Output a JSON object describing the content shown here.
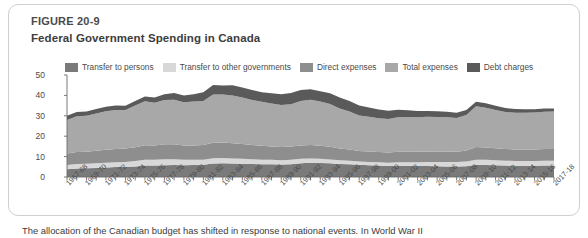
{
  "figure": {
    "number": "FIGURE 20-9",
    "title": "Federal Government Spending in Canada",
    "caption": "The allocation of the Canadian budget has shifted in response to national events. In World War II"
  },
  "legend": {
    "position": "top",
    "items": [
      {
        "label": "Transfer to persons",
        "color": "#7a7a7a",
        "icon": "legend-swatch"
      },
      {
        "label": "Transfer to other governments",
        "color": "#d8d8d8",
        "icon": "legend-swatch"
      },
      {
        "label": "Direct expenses",
        "color": "#8e8e8e",
        "icon": "legend-swatch"
      },
      {
        "label": "Total expenses",
        "color": "#a8a8a8",
        "icon": "legend-swatch"
      },
      {
        "label": "Debt charges",
        "color": "#5a5a5a",
        "icon": "legend-swatch"
      }
    ]
  },
  "chart_data": {
    "type": "area",
    "title": "Federal Government Spending in Canada",
    "xlabel": "",
    "ylabel": "",
    "ylim": [
      0,
      50
    ],
    "yticks": [
      0,
      10,
      20,
      30,
      40,
      50
    ],
    "ytick_labels": [
      "0",
      "10",
      "20",
      "30",
      "40",
      "50"
    ],
    "grid": false,
    "stacked": true,
    "legend_position": "top",
    "categories": [
      "1967-68",
      "1968-69",
      "1969-70",
      "1970-71",
      "1971-72",
      "1972-73",
      "1973-74",
      "1974-75",
      "1975-76",
      "1976-77",
      "1977-78",
      "1978-79",
      "1979-80",
      "1980-81",
      "1981-82",
      "1982-83",
      "1983-84",
      "1984-85",
      "1985-86",
      "1986-87",
      "1987-88",
      "1988-89",
      "1989-90",
      "1990-91",
      "1991-92",
      "1992-93",
      "1993-94",
      "1994-95",
      "1995-96",
      "1996-97",
      "1997-98",
      "1998-99",
      "1999-00",
      "2000-01",
      "2001-02",
      "2002-03",
      "2003-04",
      "2004-05",
      "2005-06",
      "2006-07",
      "2007-08",
      "2008-09",
      "2009-10",
      "2010-11",
      "2011-12",
      "2012-13",
      "2013-14",
      "2014-15",
      "2015-16",
      "2016-17",
      "2017-18"
    ],
    "xtick_labels": [
      "1967-68",
      "1969-70",
      "1971-72",
      "1973-74",
      "1975-76",
      "1977-78",
      "1979-80",
      "1981-82",
      "1983-84",
      "1985-86",
      "1987-88",
      "1989-90",
      "1991-92",
      "1993-94",
      "1995-96",
      "1997-98",
      "1999-00",
      "2001-02",
      "2003-04",
      "2005-06",
      "2007-08",
      "2009-10",
      "2011-12",
      "2013-14",
      "2015-16",
      "2017-18"
    ],
    "series": [
      {
        "name": "Transfer to persons",
        "color": "#7a7a7a",
        "values": [
          3.8,
          4.2,
          4.3,
          4.4,
          4.6,
          4.9,
          5.0,
          5.2,
          5.6,
          5.6,
          5.8,
          5.9,
          5.8,
          5.9,
          6.0,
          6.6,
          6.7,
          6.6,
          6.5,
          6.4,
          6.3,
          6.2,
          6.1,
          6.3,
          6.8,
          7.0,
          6.9,
          6.7,
          6.4,
          6.3,
          6.0,
          5.8,
          5.6,
          5.4,
          5.5,
          5.5,
          5.4,
          5.4,
          5.3,
          5.2,
          5.1,
          5.3,
          6.0,
          5.9,
          5.7,
          5.6,
          5.5,
          5.5,
          5.5,
          5.6,
          5.6
        ]
      },
      {
        "name": "Transfer to other governments",
        "color": "#d8d8d8",
        "values": [
          2.1,
          2.2,
          2.2,
          2.3,
          2.4,
          2.3,
          2.4,
          2.6,
          2.8,
          2.8,
          2.9,
          2.8,
          2.6,
          2.5,
          2.5,
          2.6,
          2.6,
          2.5,
          2.4,
          2.3,
          2.2,
          2.2,
          2.1,
          2.1,
          2.1,
          2.1,
          2.0,
          1.9,
          1.8,
          1.7,
          1.6,
          1.6,
          1.6,
          1.6,
          1.7,
          1.7,
          1.8,
          1.9,
          2.0,
          2.1,
          2.2,
          2.3,
          2.5,
          2.5,
          2.5,
          2.4,
          2.4,
          2.4,
          2.4,
          2.4,
          2.4
        ]
      },
      {
        "name": "Direct expenses",
        "color": "#8e8e8e",
        "values": [
          5.6,
          5.8,
          5.9,
          6.2,
          6.4,
          6.5,
          6.6,
          6.8,
          7.2,
          7.1,
          7.3,
          7.3,
          7.0,
          7.1,
          7.2,
          7.6,
          7.6,
          7.5,
          7.3,
          7.0,
          6.8,
          6.6,
          6.5,
          6.5,
          6.6,
          6.6,
          6.4,
          6.2,
          5.8,
          5.5,
          5.2,
          5.1,
          5.0,
          5.0,
          5.2,
          5.2,
          5.2,
          5.2,
          5.2,
          5.2,
          5.1,
          5.4,
          6.2,
          6.1,
          5.9,
          5.7,
          5.6,
          5.6,
          5.6,
          5.7,
          5.7
        ]
      },
      {
        "name": "Total expenses",
        "color": "#a8a8a8",
        "values": [
          16.5,
          17.6,
          17.6,
          18.2,
          18.8,
          19.2,
          18.8,
          20.4,
          21.5,
          20.9,
          21.7,
          21.9,
          21.2,
          21.5,
          21.6,
          23.7,
          23.6,
          23.4,
          22.8,
          22.1,
          21.6,
          21.0,
          20.6,
          20.8,
          21.8,
          22.2,
          21.7,
          21.0,
          19.6,
          18.6,
          17.4,
          17.0,
          16.6,
          16.4,
          16.9,
          17.0,
          16.9,
          17.0,
          16.9,
          16.8,
          16.5,
          17.4,
          20.0,
          19.5,
          18.8,
          18.2,
          18.0,
          18.0,
          18.1,
          18.3,
          18.4
        ]
      },
      {
        "name": "Debt charges",
        "color": "#5a5a5a",
        "values": [
          2.0,
          2.1,
          2.1,
          2.2,
          2.2,
          2.1,
          2.1,
          2.3,
          2.4,
          2.6,
          2.9,
          3.3,
          3.4,
          3.6,
          4.2,
          4.6,
          4.4,
          5.0,
          4.9,
          4.8,
          4.7,
          5.0,
          5.3,
          5.5,
          5.3,
          5.1,
          5.0,
          5.2,
          5.4,
          5.2,
          4.9,
          4.6,
          4.3,
          4.1,
          3.7,
          3.3,
          3.1,
          2.9,
          2.8,
          2.7,
          2.6,
          2.4,
          2.2,
          2.1,
          2.0,
          1.9,
          1.8,
          1.7,
          1.6,
          1.6,
          1.5
        ]
      }
    ],
    "annotations": []
  }
}
